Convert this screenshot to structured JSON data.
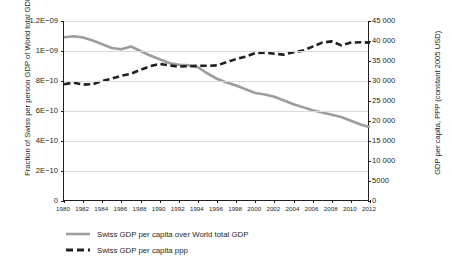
{
  "chart_data": {
    "type": "line",
    "title": "",
    "xlabel": "",
    "x": [
      1980,
      1981,
      1982,
      1983,
      1984,
      1985,
      1986,
      1987,
      1988,
      1989,
      1990,
      1991,
      1992,
      1993,
      1994,
      1995,
      1996,
      1997,
      1998,
      1999,
      2000,
      2001,
      2002,
      2003,
      2004,
      2005,
      2006,
      2007,
      2008,
      2009,
      2010,
      2011,
      2012
    ],
    "xlim": [
      1980,
      2012
    ],
    "xticks": [
      1980,
      1982,
      1984,
      1986,
      1988,
      1990,
      1992,
      1994,
      1996,
      1998,
      2000,
      2002,
      2004,
      2006,
      2008,
      2010,
      2012
    ],
    "xticklabels": [
      "1980",
      "1982",
      "1984",
      "1986",
      "1988",
      "1990",
      "1992",
      "1994",
      "1996",
      "1998",
      "2000",
      "2002",
      "2004",
      "2006",
      "2008",
      "2010",
      "2012"
    ],
    "grid": true,
    "legend_position": "below-left",
    "axes": [
      {
        "id": "left",
        "ylabel": "Fraction of Swiss per person GDP of World total GDP",
        "ylim": [
          0,
          1.2e-09
        ],
        "yticks": [
          0,
          2e-10,
          4e-10,
          6e-10,
          8e-10,
          1e-09,
          1.2e-09
        ],
        "yticklabels": [
          "0",
          "2E−10",
          "4E−10",
          "6E−10",
          "8E−10",
          "1E−09",
          "1.2E−09"
        ]
      },
      {
        "id": "right",
        "ylabel": "GDP per capita, PPP (constant 2005 USD)",
        "ylim": [
          0,
          45000
        ],
        "yticks": [
          0,
          5000,
          10000,
          15000,
          20000,
          25000,
          30000,
          35000,
          40000,
          45000
        ],
        "yticklabels": [
          "0",
          "5000",
          "10 000",
          "15 000",
          "20 000",
          "25 000",
          "30 000",
          "35 000",
          "40 000",
          "45 000"
        ]
      }
    ],
    "series": [
      {
        "name": "Swiss GDP per capita over World total GDP",
        "axis": "left",
        "color": "#9d9d9d",
        "style": "solid",
        "width": 2.6,
        "values": [
          1.092e-09,
          1.098e-09,
          1.09e-09,
          1.07e-09,
          1.045e-09,
          1.02e-09,
          1.012e-09,
          1.03e-09,
          1e-09,
          9.7e-10,
          9.45e-10,
          9.2e-10,
          9.08e-10,
          9.05e-10,
          8.92e-10,
          8.5e-10,
          8.15e-10,
          7.9e-10,
          7.7e-10,
          7.45e-10,
          7.2e-10,
          7.1e-10,
          6.95e-10,
          6.7e-10,
          6.45e-10,
          6.25e-10,
          6.05e-10,
          5.9e-10,
          5.75e-10,
          5.6e-10,
          5.35e-10,
          5.1e-10,
          4.92e-10
        ]
      },
      {
        "name": "Swiss GDP per capita ppp",
        "axis": "right",
        "color": "#231f20",
        "style": "dashed",
        "width": 2.6,
        "values": [
          29200,
          29600,
          29100,
          29200,
          30000,
          30600,
          31300,
          31800,
          32800,
          33700,
          34300,
          33900,
          33600,
          33700,
          33800,
          33800,
          33900,
          34700,
          35500,
          36100,
          37000,
          37100,
          36800,
          36600,
          37200,
          37600,
          38600,
          39600,
          39900,
          38900,
          39600,
          39700,
          39600
        ]
      }
    ]
  },
  "legend": {
    "items": [
      {
        "label": "Swiss GDP per capita over World total GDP",
        "marker": "solid-gray-line"
      },
      {
        "label": "Swiss GDP per capita ppp",
        "marker": "dashed-black-line"
      }
    ]
  }
}
